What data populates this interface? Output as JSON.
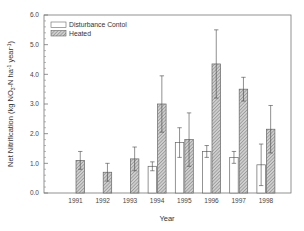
{
  "chart_data": {
    "type": "bar",
    "title": "",
    "xlabel": "Year",
    "ylabel": "Net Nitrification (kg NO3-N ha-1 year-1)",
    "ylabel_parts": {
      "pre": "Net Nitrification (kg NO",
      "sub": "3",
      "mid": "-N ha",
      "sup1": "-1",
      "mid2": " year",
      "sup2": "-1",
      "post": ")"
    },
    "ylim": [
      0,
      6
    ],
    "yticks": [
      "0.0",
      "1.0",
      "2.0",
      "3.0",
      "4.0",
      "5.0",
      "6.0"
    ],
    "categories": [
      "1991",
      "1992",
      "1993",
      "1994",
      "1995",
      "1996",
      "1997",
      "1998"
    ],
    "legend_position": "top-left",
    "grid": false,
    "series": [
      {
        "name": "Disturbance Contol",
        "pattern": "open",
        "values": [
          null,
          null,
          null,
          0.9,
          1.7,
          1.4,
          1.2,
          0.95
        ],
        "errors": [
          null,
          null,
          null,
          0.15,
          0.5,
          0.2,
          0.2,
          0.7
        ]
      },
      {
        "name": "Heated",
        "pattern": "hatched",
        "values": [
          1.1,
          0.7,
          1.15,
          3.0,
          1.8,
          4.35,
          3.5,
          2.15
        ],
        "errors": [
          0.3,
          0.3,
          0.4,
          0.95,
          0.9,
          1.15,
          0.4,
          0.8
        ]
      }
    ]
  }
}
